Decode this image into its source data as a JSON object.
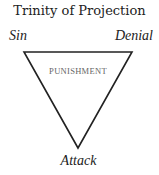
{
  "diagram": {
    "title": "Trinity of Projection",
    "vertices": {
      "top_left": "Sin",
      "top_right": "Denial",
      "bottom": "Attack"
    },
    "center_label": "PUNISHMENT",
    "shape": "inverted-triangle",
    "colors": {
      "stroke": "#222222",
      "text": "#222222",
      "center_text": "#666666"
    }
  }
}
